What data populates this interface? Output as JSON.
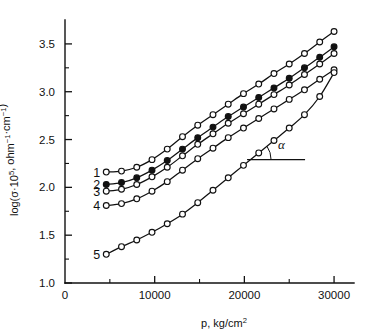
{
  "chart_data": {
    "type": "line",
    "title": "",
    "xlabel": "p, kg/cm2",
    "xlabel_parts": {
      "symbol": "p",
      "separator": ", ",
      "unit": "kg/cm",
      "unit_exponent": "2"
    },
    "ylabel": "log(sigma*10^5, ohm^-1 . cm^-1)",
    "ylabel_parts": {
      "prefix": "log(",
      "symbol": "σ",
      "middot": "·10",
      "exp1": "5",
      "comma": ", ohm",
      "exp2": "−1",
      "dot": "·cm",
      "exp3": "−1",
      "suffix": ")"
    },
    "xlim": [
      0,
      32000
    ],
    "ylim": [
      1.0,
      3.75
    ],
    "xticks": [
      0,
      10000,
      20000,
      30000
    ],
    "xticklabels": [
      "0",
      "10000",
      "20000",
      "30000"
    ],
    "xticks_minor": [
      5000,
      15000,
      25000
    ],
    "yticks": [
      1.0,
      1.5,
      2.0,
      2.5,
      3.0,
      3.5
    ],
    "yticklabels": [
      "1.0",
      "1.5",
      "2.0",
      "2.5",
      "3.0",
      "3.5"
    ],
    "yticks_minor": [
      1.25,
      1.75,
      2.25,
      2.75,
      3.25
    ],
    "grid": false,
    "legend": "inline-curve-numbers",
    "annotations": [
      {
        "name": "slope-angle",
        "text": "α",
        "x": 25600,
        "y": 2.47,
        "describes": "slope angle of linear region, curve 5"
      }
    ],
    "series": [
      {
        "name": "1",
        "label": "1",
        "marker": "open-circle",
        "color": "#111111",
        "x": [
          4600,
          6300,
          8000,
          9700,
          11400,
          13100,
          14800,
          16500,
          18200,
          19900,
          21600,
          23300,
          25000,
          26700,
          28400,
          30000
        ],
        "y": [
          2.16,
          2.17,
          2.21,
          2.29,
          2.4,
          2.53,
          2.65,
          2.76,
          2.87,
          2.98,
          3.08,
          3.19,
          3.29,
          3.4,
          3.52,
          3.63
        ]
      },
      {
        "name": "2",
        "label": "2",
        "marker": "filled-circle",
        "color": "#111111",
        "x": [
          4600,
          6300,
          8000,
          9700,
          11400,
          13100,
          14800,
          16500,
          18200,
          19900,
          21600,
          23300,
          25000,
          26700,
          28400,
          30000
        ],
        "y": [
          2.03,
          2.05,
          2.1,
          2.18,
          2.28,
          2.4,
          2.52,
          2.63,
          2.74,
          2.84,
          2.94,
          3.04,
          3.14,
          3.25,
          3.36,
          3.47
        ]
      },
      {
        "name": "3",
        "label": "3",
        "marker": "open-circle",
        "color": "#111111",
        "x": [
          4600,
          6300,
          8000,
          9700,
          11400,
          13100,
          14800,
          16500,
          18200,
          19900,
          21600,
          23300,
          25000,
          26700,
          28400,
          30000
        ],
        "y": [
          1.96,
          1.98,
          2.03,
          2.11,
          2.21,
          2.33,
          2.45,
          2.56,
          2.67,
          2.77,
          2.87,
          2.97,
          3.07,
          3.18,
          3.29,
          3.4
        ]
      },
      {
        "name": "4",
        "label": "4",
        "marker": "open-circle",
        "color": "#111111",
        "x": [
          4600,
          6300,
          8000,
          9700,
          11400,
          13100,
          14800,
          16500,
          18200,
          19900,
          21600,
          23300,
          25000,
          26700,
          28400,
          30000
        ],
        "y": [
          1.81,
          1.83,
          1.88,
          1.96,
          2.06,
          2.18,
          2.3,
          2.41,
          2.52,
          2.62,
          2.72,
          2.82,
          2.92,
          3.02,
          3.13,
          3.23
        ]
      },
      {
        "name": "5",
        "label": "5",
        "marker": "open-circle",
        "color": "#111111",
        "x": [
          4600,
          6300,
          8000,
          9700,
          11400,
          13100,
          14800,
          16500,
          18200,
          19900,
          21600,
          23300,
          25000,
          26700,
          28400,
          30000
        ],
        "y": [
          1.3,
          1.38,
          1.45,
          1.53,
          1.62,
          1.72,
          1.84,
          1.97,
          2.1,
          2.23,
          2.36,
          2.49,
          2.62,
          2.76,
          2.95,
          3.2
        ]
      }
    ]
  }
}
